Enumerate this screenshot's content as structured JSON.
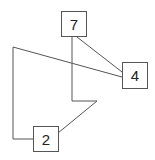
{
  "diagram": {
    "nodes": [
      {
        "id": "n7",
        "label": "7",
        "x": 61,
        "y": 11,
        "w": 26,
        "h": 26
      },
      {
        "id": "n4",
        "label": "4",
        "x": 122,
        "y": 62,
        "w": 26,
        "h": 27
      },
      {
        "id": "n2",
        "label": "2",
        "x": 33,
        "y": 126,
        "w": 26,
        "h": 26
      }
    ],
    "edges": [
      {
        "from": "7",
        "to": "4",
        "points": "77,37 122,72"
      },
      {
        "from": "4",
        "to": "2",
        "points": "122,77 13,47 13,139 33,139"
      },
      {
        "from": "7",
        "to": "2",
        "points": "72,37 72,101 97,101 58,133"
      }
    ],
    "line_color": "#555555"
  }
}
